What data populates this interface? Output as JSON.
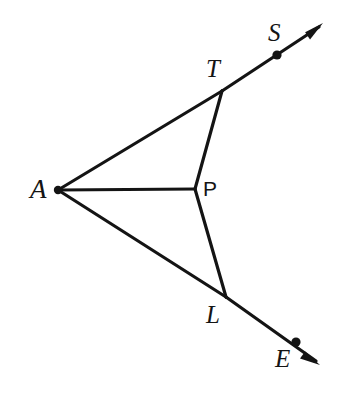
{
  "figure": {
    "background_color": "#ffffff",
    "stroke_color": "#141414",
    "stroke_width": 3.2,
    "width": 349,
    "height": 397,
    "points": [
      {
        "id": "A",
        "label": "A",
        "x": 58,
        "y": 190,
        "label_x": 30,
        "label_y": 176,
        "style": "italic-serif",
        "font_size": 27,
        "dot": true,
        "dot_r": 4.2
      },
      {
        "id": "T",
        "label": "T",
        "x": 222,
        "y": 91,
        "label_x": 206,
        "label_y": 56,
        "style": "italic-serif",
        "font_size": 25,
        "dot": false,
        "dot_r": 0
      },
      {
        "id": "P",
        "label": "P",
        "x": 195,
        "y": 189,
        "label_x": 203,
        "label_y": 178,
        "style": "upright-sans",
        "font_size": 21,
        "dot": false,
        "dot_r": 0
      },
      {
        "id": "L",
        "label": "L",
        "x": 226,
        "y": 297,
        "label_x": 206,
        "label_y": 302,
        "style": "italic-serif",
        "font_size": 25,
        "dot": false,
        "dot_r": 0
      },
      {
        "id": "S",
        "label": "S",
        "x": 277,
        "y": 55,
        "label_x": 268,
        "label_y": 20,
        "style": "italic-serif",
        "font_size": 25,
        "dot": true,
        "dot_r": 4.6
      },
      {
        "id": "E",
        "label": "E",
        "x": 296,
        "y": 342,
        "label_x": 275,
        "label_y": 346,
        "style": "italic-serif",
        "font_size": 25,
        "dot": true,
        "dot_r": 4.6
      }
    ],
    "segments": [
      {
        "id": "A-T",
        "from": "A",
        "to": "T",
        "x1": 58,
        "y1": 190,
        "x2": 222,
        "y2": 91
      },
      {
        "id": "A-P",
        "from": "A",
        "to": "P",
        "x1": 58,
        "y1": 190,
        "x2": 195,
        "y2": 189
      },
      {
        "id": "A-L",
        "from": "A",
        "to": "L",
        "x1": 58,
        "y1": 190,
        "x2": 226,
        "y2": 297
      },
      {
        "id": "T-P",
        "from": "T",
        "to": "P",
        "x1": 222,
        "y1": 91,
        "x2": 195,
        "y2": 189
      },
      {
        "id": "P-L",
        "from": "P",
        "to": "L",
        "x1": 195,
        "y1": 189,
        "x2": 226,
        "y2": 297
      }
    ],
    "rays": [
      {
        "id": "T-S",
        "from": "T",
        "through": "S",
        "x1": 222,
        "y1": 91,
        "x2": 319,
        "y2": 27,
        "tip_x": 323,
        "tip_y": 23,
        "arrow": "open-arrowhead"
      },
      {
        "id": "L-E",
        "from": "L",
        "through": "E",
        "x1": 226,
        "y1": 297,
        "x2": 316,
        "y2": 361,
        "tip_x": 320,
        "tip_y": 365,
        "arrow": "open-arrowhead"
      }
    ]
  }
}
